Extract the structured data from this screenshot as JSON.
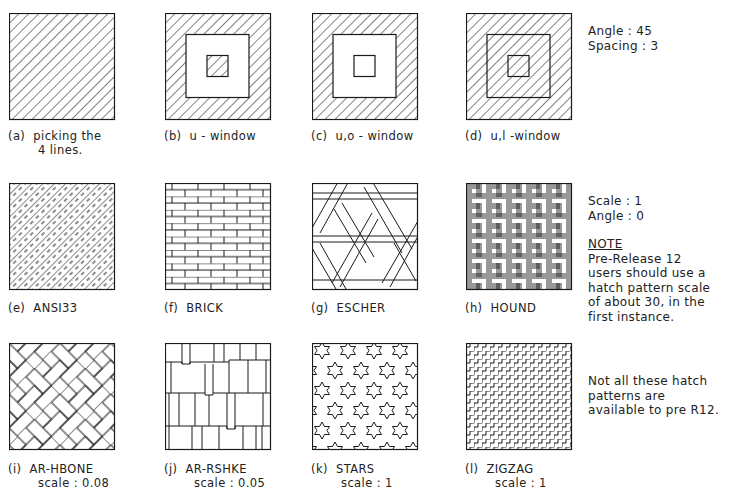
{
  "row1": {
    "panels": [
      {
        "id": "a",
        "caption_line1": "(a)  picking the",
        "caption_line2": "4 lines.",
        "pattern": "ansi31-full"
      },
      {
        "id": "b",
        "caption_line1": "(b)  u - window",
        "caption_line2": "",
        "pattern": "outer-ring-and-inner-island"
      },
      {
        "id": "c",
        "caption_line1": "(c)  u,o - window",
        "caption_line2": "",
        "pattern": "outer-ring-only"
      },
      {
        "id": "d",
        "caption_line1": "(d)  u,l -window",
        "caption_line2": "",
        "pattern": "ignore-islands"
      }
    ],
    "settings": {
      "angle": "Angle : 45",
      "spacing": "Spacing : 3"
    }
  },
  "row2": {
    "panels": [
      {
        "id": "e",
        "caption_line1": "(e)  ANSI33",
        "pattern": "ansi33"
      },
      {
        "id": "f",
        "caption_line1": "(f)  BRICK",
        "pattern": "brick"
      },
      {
        "id": "g",
        "caption_line1": "(g)  ESCHER",
        "pattern": "escher"
      },
      {
        "id": "h",
        "caption_line1": "(h)  HOUND",
        "pattern": "hound"
      }
    ],
    "settings": {
      "scale": "Scale : 1",
      "angle": "Angle : 0"
    },
    "note": {
      "heading": "NOTE",
      "lines": [
        "Pre-Release 12",
        "users should use a",
        "hatch pattern scale",
        "of about 30, in the",
        "first instance."
      ]
    }
  },
  "row3": {
    "panels": [
      {
        "id": "i",
        "caption_line1": "(i)  AR-HBONE",
        "caption_line2": "scale : 0.08",
        "pattern": "ar-hbone"
      },
      {
        "id": "j",
        "caption_line1": "(j)  AR-RSHKE",
        "caption_line2": "scale : 0.05",
        "pattern": "ar-rshke"
      },
      {
        "id": "k",
        "caption_line1": "(k)  STARS",
        "caption_line2": "scale : 1",
        "pattern": "stars"
      },
      {
        "id": "l",
        "caption_line1": "(l)  ZIGZAG",
        "caption_line2": "scale : 1",
        "pattern": "zigzag"
      }
    ],
    "note_lines": [
      "Not all these hatch",
      "patterns are",
      "available to pre R12."
    ]
  },
  "colors": {
    "line": "#1a1a1a",
    "background": "#ffffff"
  }
}
